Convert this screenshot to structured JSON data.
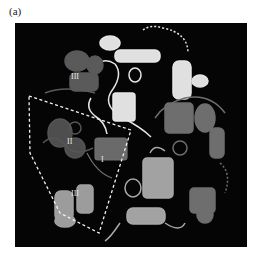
{
  "figure": {
    "panel_label": "(a)",
    "background_color": "#050505",
    "domain_labels": [
      {
        "id": "III_top",
        "text": "III"
      },
      {
        "id": "II",
        "text": "II"
      },
      {
        "id": "I",
        "text": "I"
      },
      {
        "id": "III_bottom",
        "text": "III"
      }
    ],
    "colors": {
      "subunit_white": "#e6e6e6",
      "subunit_light_gray": "#a8a8a8",
      "subunit_mid_gray": "#7a7a7a",
      "subunit_dark_gray": "#555555",
      "outline_dash": "#ffffff"
    }
  }
}
